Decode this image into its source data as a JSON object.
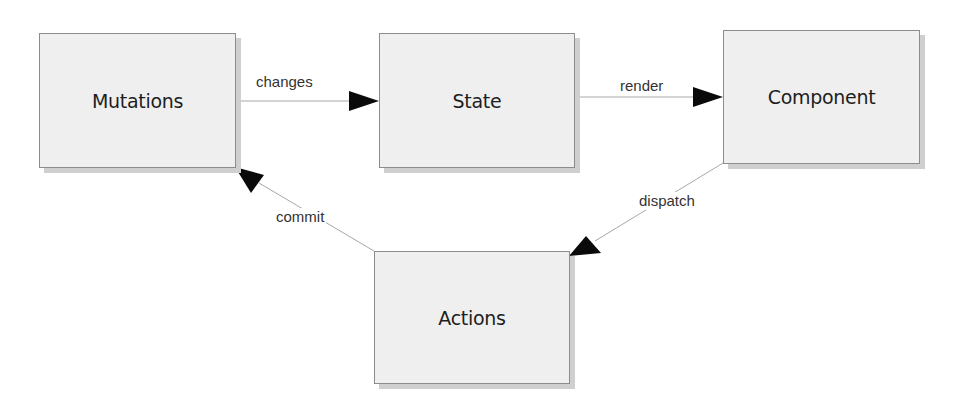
{
  "diagram": {
    "type": "flowchart",
    "title": "",
    "nodes": [
      {
        "id": "mutations",
        "label": "Mutations"
      },
      {
        "id": "state",
        "label": "State"
      },
      {
        "id": "component",
        "label": "Component"
      },
      {
        "id": "actions",
        "label": "Actions"
      }
    ],
    "edges": [
      {
        "from": "mutations",
        "to": "state",
        "label": "changes"
      },
      {
        "from": "state",
        "to": "component",
        "label": "render"
      },
      {
        "from": "component",
        "to": "actions",
        "label": "dispatch"
      },
      {
        "from": "actions",
        "to": "mutations",
        "label": "commit"
      }
    ],
    "colors": {
      "node_fill": "#efefef",
      "node_border": "#8c8c8c",
      "node_shadow": "#cfcfcf",
      "edge_line": "#a8a8a8",
      "arrowhead": "#0a0a0a",
      "text": "#1e1e1e"
    }
  }
}
